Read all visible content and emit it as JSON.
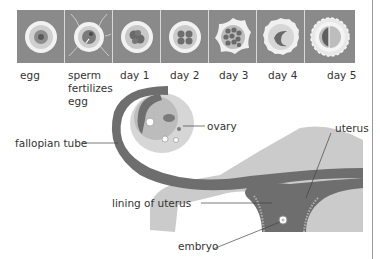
{
  "stages": [
    {
      "id": "egg",
      "label": "egg",
      "x": 20
    },
    {
      "id": "sperm-fertilizes-egg",
      "label": "sperm\nfertilizes\negg",
      "x": 68
    },
    {
      "id": "day-1",
      "label": "day 1",
      "x": 120
    },
    {
      "id": "day-2",
      "label": "day 2",
      "x": 170
    },
    {
      "id": "day-3",
      "label": "day 3",
      "x": 219
    },
    {
      "id": "day-4",
      "label": "day 4",
      "x": 268
    },
    {
      "id": "day-5",
      "label": "day 5",
      "x": 327
    }
  ],
  "anatomy_labels": {
    "fallopian_tube": "fallopian tube",
    "ovary": "ovary",
    "uterus": "uterus",
    "lining_of_uterus": "lining of uterus",
    "embryo": "embryo"
  },
  "colors": {
    "panel_bg": "#8a8a8a",
    "tissue_dark": "#6e6e6e",
    "tissue_light": "#c8c8c8",
    "tissue_mid": "#a8a8a8"
  }
}
